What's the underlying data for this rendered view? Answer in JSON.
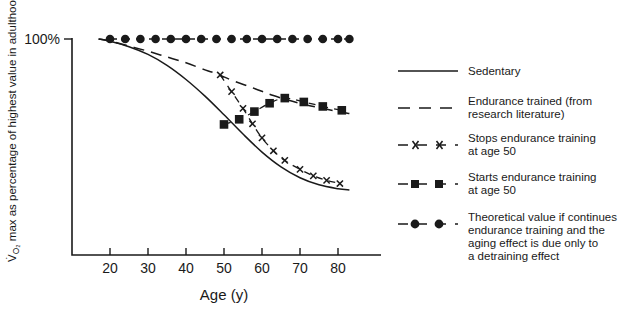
{
  "chart_data": {
    "type": "line",
    "title": "",
    "xlabel": "Age (y)",
    "ylabel": "V̇O2 max as percentage of highest value in adulthood",
    "ylabel_main_pre": "V",
    "ylabel_sub": "2",
    "ylabel_main_post": "O",
    "ylabel_rest": " max as percentage of highest value in adulthood",
    "xlim": [
      15,
      85
    ],
    "ylim": [
      40,
      105
    ],
    "xticks": [
      20,
      30,
      40,
      50,
      60,
      70,
      80
    ],
    "xticklabels": [
      "20",
      "30",
      "40",
      "50",
      "60",
      "70",
      "80"
    ],
    "yticks": [
      100
    ],
    "yticklabels": [
      "100%"
    ],
    "grid": false,
    "legend_position": "right",
    "series": [
      {
        "name": "Sedentary",
        "style": "solid",
        "marker": "none",
        "x": [
          17,
          20,
          25,
          30,
          35,
          40,
          45,
          50,
          55,
          60,
          65,
          70,
          75,
          80,
          83
        ],
        "values": [
          100,
          99.3,
          97.6,
          95.2,
          91.8,
          87.4,
          82.2,
          76.4,
          70.4,
          64.8,
          60.2,
          56.8,
          54.6,
          53.4,
          53.0
        ]
      },
      {
        "name": "Endurance trained (from research literature)",
        "style": "dashed",
        "marker": "none",
        "x": [
          17,
          20,
          25,
          30,
          35,
          40,
          45,
          48,
          52,
          58,
          63,
          68,
          72,
          76,
          80,
          83
        ],
        "values": [
          100,
          99.4,
          97.8,
          96.2,
          94.4,
          92.6,
          90.4,
          89.2,
          87.2,
          84.6,
          82.4,
          80.6,
          79.4,
          78.4,
          77.4,
          76.8
        ]
      },
      {
        "name": "Stops endurance training at age 50",
        "style": "dash-marker",
        "marker": "x",
        "x": [
          49,
          52,
          55,
          57.5,
          60,
          63,
          66,
          70,
          73.5,
          77,
          80.5
        ],
        "values": [
          88.8,
          83.6,
          78.4,
          73.6,
          69.2,
          65.2,
          62.2,
          59.4,
          57.4,
          56.0,
          55.0
        ]
      },
      {
        "name": "Starts endurance training at age 50",
        "style": "dash-marker",
        "marker": "square",
        "x": [
          50,
          54,
          58,
          62,
          66,
          71,
          76,
          81
        ],
        "values": [
          73.4,
          75.0,
          77.4,
          80.0,
          81.6,
          80.4,
          79.0,
          77.8
        ]
      },
      {
        "name": "Theoretical value if continues endurance training and the aging effect is due only to a detraining effect",
        "style": "dash-marker",
        "marker": "circle",
        "x": [
          20,
          24,
          28,
          32,
          36,
          40,
          44,
          48,
          52,
          56,
          60,
          64,
          68,
          72,
          76,
          80,
          83
        ],
        "values": [
          100,
          100,
          100,
          100,
          100,
          100,
          100,
          100,
          100,
          100,
          100,
          100,
          100,
          100,
          100,
          100,
          100
        ]
      }
    ]
  },
  "legend": {
    "items": [
      {
        "label": "Sedentary",
        "marker": "none",
        "style": "solid"
      },
      {
        "label": "Endurance trained (from\nresearch literature)",
        "line1": "Endurance trained (from",
        "line2": "research literature)",
        "marker": "none",
        "style": "dashed"
      },
      {
        "label": "Stops endurance training\nat age 50",
        "line1": "Stops endurance training",
        "line2": "at age 50",
        "marker": "x",
        "style": "dash-marker"
      },
      {
        "label": "Starts endurance training\nat age 50",
        "line1": "Starts endurance training",
        "line2": "at age 50",
        "marker": "square",
        "style": "dash-marker"
      },
      {
        "label": "Theoretical value if continues endurance training and the aging effect is due only to a detraining effect",
        "line1": "Theoretical value if continues",
        "line2": "endurance training and the",
        "line3": "aging effect is due only to",
        "line4": "a detraining effect",
        "marker": "circle",
        "style": "dash-marker"
      }
    ]
  },
  "colors": {
    "ink": "#1a1a1a",
    "background": "#ffffff"
  }
}
